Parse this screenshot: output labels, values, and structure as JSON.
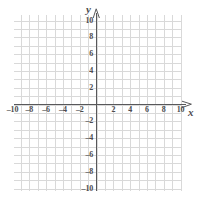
{
  "figure": {
    "name": "cartesian-coordinate-plane",
    "background_color": "#ffffff",
    "grid_color": "#d9d9d9",
    "axis_color": "#58585a",
    "label_color": "#4d4d4f"
  },
  "axes": {
    "x_name": "x",
    "y_name": "y",
    "x_arrow": "arrow-right",
    "y_arrow": "arrow-up"
  },
  "chart_data": {
    "type": "scatter",
    "title": "",
    "subtitle": "",
    "xlabel": "x",
    "ylabel": "y",
    "grid": true,
    "legend": null,
    "xlim": [
      -11,
      11
    ],
    "ylim": [
      -11,
      11
    ],
    "xticks": [
      -10,
      -8,
      -6,
      -4,
      -2,
      2,
      4,
      6,
      8,
      10
    ],
    "yticks": [
      10,
      8,
      6,
      4,
      2,
      -2,
      -4,
      -6,
      -8,
      -10
    ],
    "xtick_labels": [
      "–10",
      "–8",
      "–6",
      "–4",
      "–2",
      "2",
      "4",
      "6",
      "8",
      "10"
    ],
    "ytick_labels": [
      "10",
      "8",
      "6",
      "4",
      "2",
      "–2",
      "–4",
      "–6",
      "–8",
      "–10"
    ],
    "minor_grid_step": 1,
    "major_tick_step": 2,
    "series": [],
    "values": [],
    "annotations": []
  },
  "x_tick_labels": [
    {
      "value": -10,
      "text": "–10"
    },
    {
      "value": -8,
      "text": "–8"
    },
    {
      "value": -6,
      "text": "–6"
    },
    {
      "value": -4,
      "text": "–4"
    },
    {
      "value": -2,
      "text": "–2"
    },
    {
      "value": 2,
      "text": "2"
    },
    {
      "value": 4,
      "text": "4"
    },
    {
      "value": 6,
      "text": "6"
    },
    {
      "value": 8,
      "text": "8"
    },
    {
      "value": 10,
      "text": "10"
    }
  ],
  "y_tick_labels": [
    {
      "value": 10,
      "text": "10"
    },
    {
      "value": 8,
      "text": "8"
    },
    {
      "value": 6,
      "text": "6"
    },
    {
      "value": 4,
      "text": "4"
    },
    {
      "value": 2,
      "text": "2"
    },
    {
      "value": -2,
      "text": "–2"
    },
    {
      "value": -4,
      "text": "–4"
    },
    {
      "value": -6,
      "text": "–6"
    },
    {
      "value": -8,
      "text": "–8"
    },
    {
      "value": -10,
      "text": "–10"
    }
  ]
}
